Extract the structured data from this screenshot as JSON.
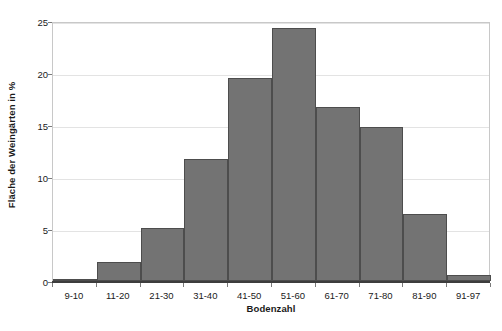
{
  "chart_data": {
    "type": "bar",
    "title": "",
    "subtitle": "",
    "xlabel": "Bodenzahl",
    "ylabel": "Fläche der Weingärten in %",
    "categories": [
      "9-10",
      "11-20",
      "21-30",
      "31-40",
      "41-50",
      "51-60",
      "61-70",
      "71-80",
      "81-90",
      "91-97"
    ],
    "values": [
      0.05,
      1.8,
      5.1,
      11.7,
      19.5,
      24.3,
      16.7,
      14.8,
      6.4,
      0.6
    ],
    "series": [
      {
        "name": "Fläche der Weingärten in %",
        "values": [
          0.05,
          1.8,
          5.1,
          11.7,
          19.5,
          24.3,
          16.7,
          14.8,
          6.4,
          0.6
        ]
      }
    ],
    "ylim": [
      0,
      25
    ],
    "yticks": [
      0,
      5,
      10,
      15,
      20,
      25
    ],
    "ytick_labels": [
      "0",
      "5",
      "10",
      "15",
      "20",
      "25"
    ],
    "grid": true,
    "grid_axis": "y",
    "legend": false,
    "legend_position": "none",
    "bar_fill_color": "#737373",
    "bar_edge_color": "#4d4d4d",
    "gridline_color": "#e3e3e3",
    "frame_color": "#c8c8c8",
    "baseline_color": "#3d3d3d",
    "text_color": "#1a1a1a",
    "background_color": "#ffffff",
    "annotations": []
  }
}
